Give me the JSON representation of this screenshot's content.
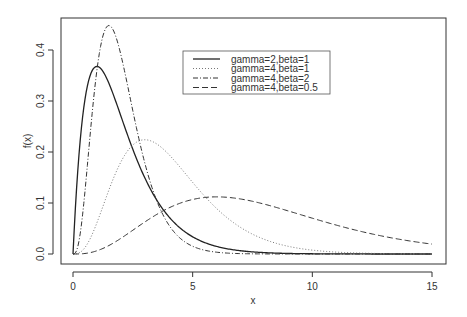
{
  "chart_data": {
    "type": "line",
    "title": "",
    "xlabel": "x",
    "ylabel": "f(x)",
    "xlim": [
      0,
      15
    ],
    "ylim": [
      0,
      0.45
    ],
    "x_ticks": [
      0,
      5,
      10,
      15
    ],
    "x_tick_labels": [
      "0",
      "5",
      "10",
      "15"
    ],
    "y_ticks": [
      0.0,
      0.1,
      0.2,
      0.3,
      0.4
    ],
    "y_tick_labels": [
      "0.0",
      "0.1",
      "0.2",
      "0.3",
      "0.4"
    ],
    "grid": false,
    "legend_position": "top-center-right",
    "series": [
      {
        "name": "gamma=2,beta=1",
        "shape": 2,
        "rate": 1,
        "line_style": "solid",
        "peak": {
          "x": 1,
          "y": 0.368
        }
      },
      {
        "name": "gamma=4,beta=1",
        "shape": 4,
        "rate": 1,
        "line_style": "dotted",
        "peak": {
          "x": 3,
          "y": 0.224
        }
      },
      {
        "name": "gamma=4,beta=2",
        "shape": 4,
        "rate": 2,
        "line_style": "dotdash",
        "peak": {
          "x": 1.5,
          "y": 0.448
        }
      },
      {
        "name": "gamma=4,beta=0.5",
        "shape": 4,
        "rate": 0.5,
        "line_style": "dashed",
        "peak": {
          "x": 6,
          "y": 0.112
        }
      }
    ]
  }
}
